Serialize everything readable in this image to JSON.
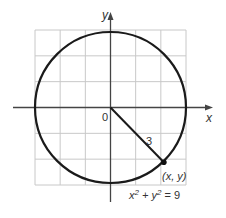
{
  "figure": {
    "type": "circle-on-grid",
    "grid": {
      "x_range": [
        -3,
        3
      ],
      "y_range": [
        -3,
        3
      ],
      "step": 1
    },
    "axes": {
      "x_label": "x",
      "y_label": "y",
      "origin_label": "0"
    },
    "circle": {
      "center": [
        0,
        0
      ],
      "radius": 3,
      "equation": "x² + y² = 9"
    },
    "radius_segment": {
      "label": "3",
      "end_point": [
        2.12,
        -2.12
      ]
    },
    "point": {
      "label": "(x, y)"
    },
    "colors": {
      "grid": "#c8c8c8",
      "axis": "#444444",
      "curve": "#1a1a1a"
    }
  }
}
